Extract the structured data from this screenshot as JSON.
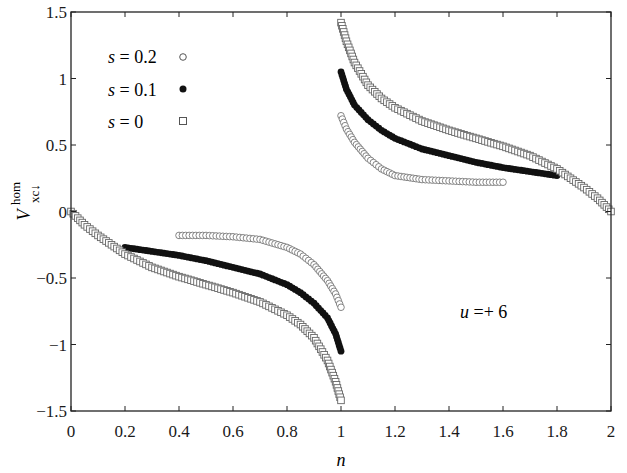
{
  "chart_data": {
    "type": "scatter",
    "title": "",
    "xlabel": "n",
    "ylabel": "V_xc↓^hom",
    "ylabel_parts": {
      "base": "V",
      "sub": "xc↓",
      "sup": "hom"
    },
    "xlim": [
      0,
      2
    ],
    "ylim": [
      -1.5,
      1.5
    ],
    "xticks": [
      0,
      0.2,
      0.4,
      0.6,
      0.8,
      1,
      1.2,
      1.4,
      1.6,
      1.8,
      2
    ],
    "xtick_labels": [
      "0",
      "0.2",
      "0.4",
      "0.6",
      "0.8",
      "1",
      "1.2",
      "1.4",
      "1.6",
      "1.8",
      "2"
    ],
    "yticks": [
      -1.5,
      -1,
      -0.5,
      0,
      0.5,
      1,
      1.5
    ],
    "ytick_labels": [
      "−1.5",
      "−1",
      "−0.5",
      "0",
      "0.5",
      "1",
      "1.5"
    ],
    "grid": false,
    "legend_position": "upper left",
    "annotation": "u =+ 6",
    "series": [
      {
        "name": "s = 0.2",
        "marker": "open-circle",
        "segments": [
          {
            "x": [
              0.4,
              0.5,
              0.6,
              0.7,
              0.8,
              0.85,
              0.9,
              0.95,
              0.98,
              1.0
            ],
            "y": [
              -0.18,
              -0.18,
              -0.19,
              -0.21,
              -0.27,
              -0.32,
              -0.4,
              -0.52,
              -0.62,
              -0.72
            ]
          },
          {
            "x": [
              1.0,
              1.02,
              1.05,
              1.1,
              1.15,
              1.2,
              1.3,
              1.4,
              1.5,
              1.6
            ],
            "y": [
              0.72,
              0.62,
              0.52,
              0.4,
              0.32,
              0.27,
              0.24,
              0.23,
              0.22,
              0.22
            ]
          }
        ]
      },
      {
        "name": "s = 0.1",
        "marker": "filled-circle",
        "segments": [
          {
            "x": [
              0.2,
              0.3,
              0.4,
              0.5,
              0.6,
              0.7,
              0.8,
              0.85,
              0.9,
              0.95,
              0.98,
              1.0
            ],
            "y": [
              -0.27,
              -0.3,
              -0.33,
              -0.37,
              -0.42,
              -0.47,
              -0.55,
              -0.61,
              -0.69,
              -0.8,
              -0.92,
              -1.05
            ]
          },
          {
            "x": [
              1.0,
              1.02,
              1.05,
              1.1,
              1.15,
              1.2,
              1.3,
              1.4,
              1.5,
              1.6,
              1.7,
              1.8
            ],
            "y": [
              1.05,
              0.92,
              0.8,
              0.69,
              0.61,
              0.55,
              0.47,
              0.42,
              0.37,
              0.33,
              0.3,
              0.27
            ]
          }
        ]
      },
      {
        "name": "s = 0",
        "marker": "open-square",
        "segments": [
          {
            "x": [
              0.0,
              0.05,
              0.1,
              0.2,
              0.3,
              0.4,
              0.5,
              0.6,
              0.7,
              0.8,
              0.85,
              0.9,
              0.95,
              0.98,
              1.0
            ],
            "y": [
              0.0,
              -0.1,
              -0.18,
              -0.32,
              -0.42,
              -0.49,
              -0.55,
              -0.61,
              -0.68,
              -0.78,
              -0.85,
              -0.95,
              -1.12,
              -1.28,
              -1.42
            ]
          },
          {
            "x": [
              1.0,
              1.02,
              1.05,
              1.1,
              1.15,
              1.2,
              1.3,
              1.4,
              1.5,
              1.6,
              1.7,
              1.8,
              1.9,
              1.95,
              2.0
            ],
            "y": [
              1.42,
              1.28,
              1.12,
              0.95,
              0.85,
              0.78,
              0.68,
              0.61,
              0.55,
              0.49,
              0.42,
              0.32,
              0.18,
              0.1,
              0.0
            ]
          }
        ]
      }
    ]
  },
  "legend": {
    "items": [
      {
        "label": "s = 0.2",
        "marker": "open-circle"
      },
      {
        "label": "s = 0.1",
        "marker": "filled-circle"
      },
      {
        "label": "s = 0",
        "marker": "open-square"
      }
    ]
  },
  "annotation": {
    "text": "u =+ 6"
  },
  "axes": {
    "xlabel": "n",
    "ylabel_base": "V",
    "ylabel_sub": "xc↓",
    "ylabel_sup": "hom"
  }
}
